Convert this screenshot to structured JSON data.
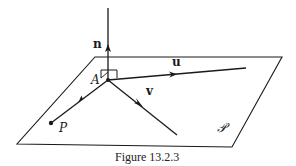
{
  "figure": {
    "caption": "Figure 13.2.3",
    "labels": {
      "normal": "n",
      "u_vector": "u",
      "v_vector": "v",
      "point_A": "A",
      "point_P": "P",
      "plane": "𝒫"
    },
    "colors": {
      "stroke": "#1a1a1a",
      "background": "#ffffff"
    }
  }
}
